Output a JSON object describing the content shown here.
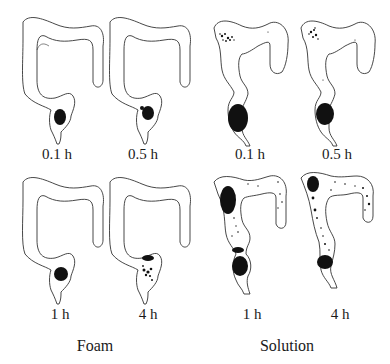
{
  "figure": {
    "groups": [
      {
        "label": "Foam",
        "panels": [
          {
            "time": "0.1 h",
            "distribution": "compact dense bolus in rectum"
          },
          {
            "time": "0.5 h",
            "distribution": "compact bolus in rectum"
          },
          {
            "time": "1 h",
            "distribution": "compact dense bolus in rectum"
          },
          {
            "time": "4 h",
            "distribution": "small scattered clusters in rectum/sigmoid"
          }
        ]
      },
      {
        "label": "Solution",
        "panels": [
          {
            "time": "0.1 h",
            "distribution": "large mass in rectum, spots in ascending/transverse colon"
          },
          {
            "time": "0.5 h",
            "distribution": "mass in rectum, cluster at hepatic flexure"
          },
          {
            "time": "1 h",
            "distribution": "spread across ascending colon, sigmoid and rectum"
          },
          {
            "time": "4 h",
            "distribution": "widely spread throughout colon, residual in rectum"
          }
        ]
      }
    ],
    "colors": {
      "outline": "#333333",
      "deposit": "#111111",
      "background": "#ffffff"
    }
  }
}
